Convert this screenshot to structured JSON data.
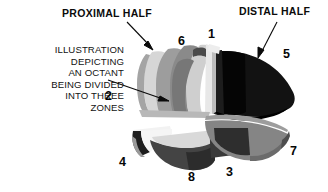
{
  "figure": {
    "title_left": "PROXIMAL HALF",
    "title_right": "DISTAL HALF",
    "caption_lines": [
      "ILLUSTRATION",
      "DEPICTING",
      "AN OCTANT",
      "BEING DIVIDED",
      "INTO THREE",
      "ZONES"
    ],
    "caption_text": "ILLUSTRATION DEPICTING AN OCTANT BEING DIVIDED INTO THREE ZONES",
    "zone_numbers": {
      "one": "1",
      "two": "2",
      "three": "3",
      "four": "4",
      "five": "5",
      "six": "6",
      "seven": "7",
      "eight": "8"
    },
    "colors": {
      "background": "#ffffff",
      "text": "#0b0b0b",
      "outline": "#1a1a1a",
      "very_light_gray": "#e8e8e8",
      "light_gray": "#d2d2d2",
      "mid_light_gray": "#b4b4b4",
      "mid_gray": "#9a9a9a",
      "mid_dark_gray": "#7d7d7d",
      "dark_gray": "#5c5c5c",
      "darker_gray": "#3c3c3c",
      "near_black": "#151515",
      "black": "#000000"
    },
    "arrows": [
      {
        "name": "proximal-half-arrow",
        "from": [
          127,
          22
        ],
        "to": [
          153,
          49
        ]
      },
      {
        "name": "distal-half-arrow",
        "from": [
          277,
          22
        ],
        "to": [
          258,
          57
        ]
      },
      {
        "name": "caption-arrow",
        "from": [
          108,
          80
        ],
        "to": [
          168,
          101
        ]
      }
    ]
  }
}
